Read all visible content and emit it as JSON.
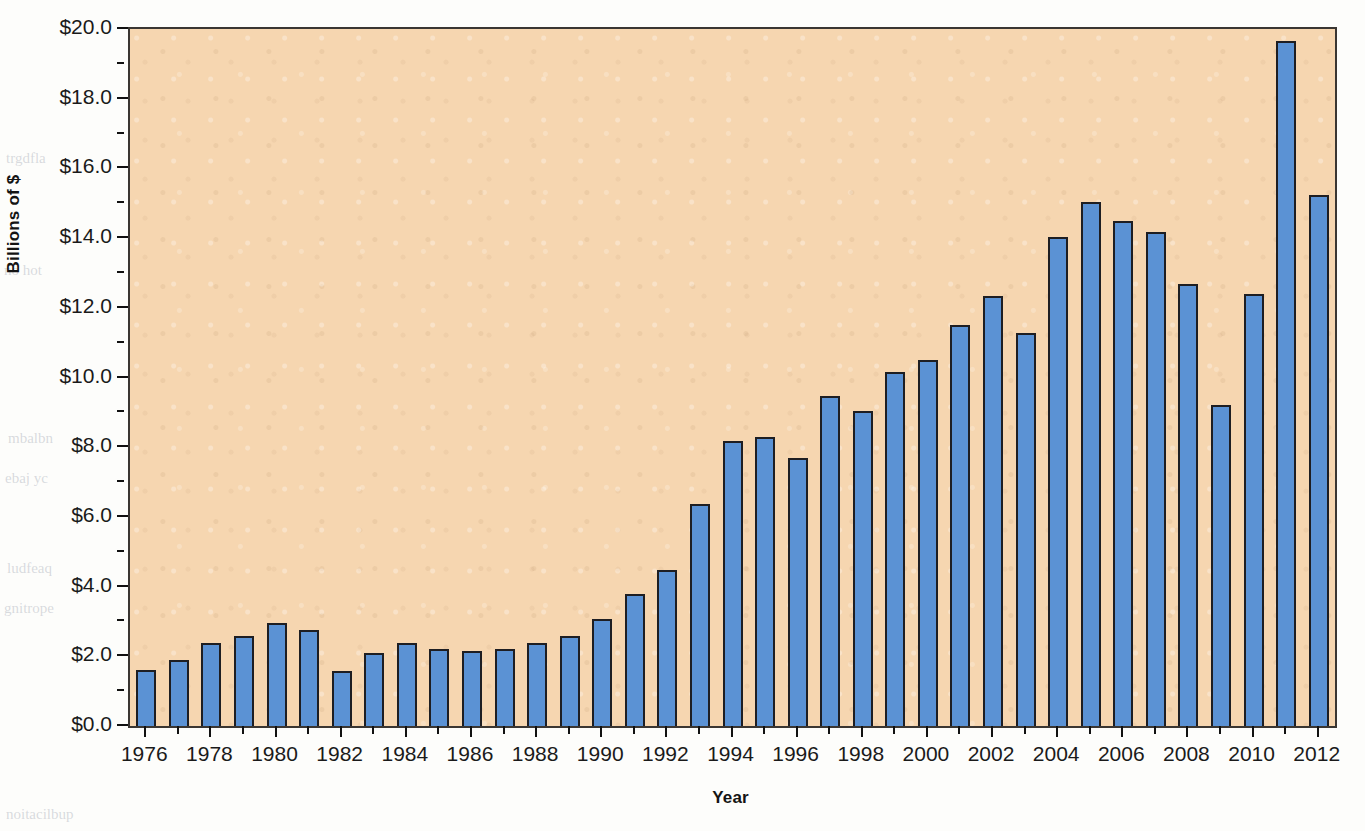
{
  "chart_data": {
    "type": "bar",
    "title": "",
    "subtitle": "",
    "xlabel": "Year",
    "ylabel": "Billions of $",
    "xlim": [
      1975.5,
      2012.5
    ],
    "ylim": [
      0,
      20
    ],
    "grid": false,
    "legend": null,
    "y_tick_labels": [
      "$0.0",
      "$2.0",
      "$4.0",
      "$6.0",
      "$8.0",
      "$10.0",
      "$12.0",
      "$14.0",
      "$16.0",
      "$18.0",
      "$20.0"
    ],
    "y_tick_values": [
      0,
      2,
      4,
      6,
      8,
      10,
      12,
      14,
      16,
      18,
      20
    ],
    "x_tick_labels": [
      "1976",
      "1978",
      "1980",
      "1982",
      "1984",
      "1986",
      "1988",
      "1990",
      "1992",
      "1994",
      "1996",
      "1998",
      "2000",
      "2002",
      "2004",
      "2006",
      "2008",
      "2010",
      "2012"
    ],
    "x_tick_values": [
      1976,
      1978,
      1980,
      1982,
      1984,
      1986,
      1988,
      1990,
      1992,
      1994,
      1996,
      1998,
      2000,
      2002,
      2004,
      2006,
      2008,
      2010,
      2012
    ],
    "categories": [
      1976,
      1977,
      1978,
      1979,
      1980,
      1981,
      1982,
      1983,
      1984,
      1985,
      1986,
      1987,
      1988,
      1989,
      1990,
      1991,
      1992,
      1993,
      1994,
      1995,
      1996,
      1997,
      1998,
      1999,
      2000,
      2001,
      2002,
      2003,
      2004,
      2005,
      2006,
      2007,
      2008,
      2009,
      2010,
      2011,
      2012
    ],
    "values": [
      1.6,
      1.9,
      2.37,
      2.57,
      2.95,
      2.75,
      1.57,
      2.1,
      2.37,
      2.22,
      2.15,
      2.2,
      2.37,
      2.58,
      3.08,
      3.8,
      4.48,
      6.38,
      8.17,
      8.28,
      7.68,
      9.48,
      9.05,
      10.15,
      10.5,
      11.5,
      12.35,
      11.27,
      14.02,
      15.05,
      14.5,
      14.17,
      12.67,
      9.2,
      12.4,
      19.67,
      15.23
    ],
    "bar_color": "#5b92d4",
    "bar_edge_color": "#1e1e22",
    "plot_background_color": "#f6d6b0",
    "axis_color": "#1a1a1a"
  },
  "bleed_text": {
    "left_1": "trgdfla",
    "left_2": "no hot",
    "left_3": "mbalbn",
    "left_4": "ebaj yc",
    "left_5": "ludfeaq",
    "left_6": "gnitrope",
    "bottom_left": "noitacilbup"
  }
}
